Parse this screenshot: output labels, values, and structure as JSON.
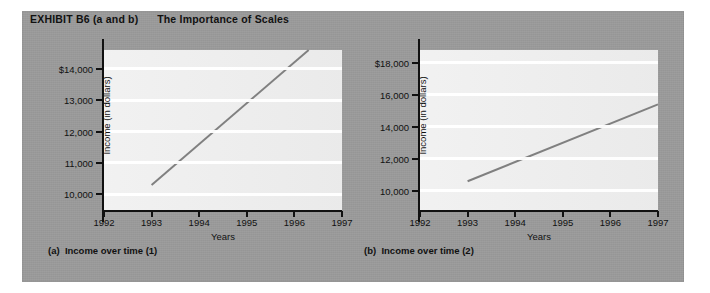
{
  "exhibit": {
    "title": "EXHIBIT B6 (a and b)      The Importance of Scales",
    "panel_color": "#9b9b9b",
    "line_color": "#808080",
    "plot_color": "#efefef",
    "gridline_color": "#ffffff"
  },
  "chart_data": [
    {
      "type": "line",
      "id": "a",
      "title": "Income over time (1)",
      "caption": "(a)  Income over time (1)",
      "xlabel": "Years",
      "ylabel": "Income (in dollars)",
      "x": [
        1993,
        1996.3
      ],
      "values": [
        10300,
        14600
      ],
      "categories": [
        "1992",
        "1993",
        "1994",
        "1995",
        "1996",
        "1997"
      ],
      "xlim": [
        1992,
        1997
      ],
      "ylim": [
        9500,
        14600
      ],
      "yticks": [
        10000,
        11000,
        12000,
        13000,
        14000
      ],
      "ytick_labels": [
        "10,000",
        "11,000",
        "12,000",
        "13,000",
        "$14,000"
      ],
      "grid": true,
      "legend": "none"
    },
    {
      "type": "line",
      "id": "b",
      "title": "Income over time (2)",
      "caption": "(b)  Income over time (2)",
      "xlabel": "Years",
      "ylabel": "Income (in dollars)",
      "x": [
        1993,
        1997
      ],
      "values": [
        10600,
        15400
      ],
      "categories": [
        "1992",
        "1993",
        "1994",
        "1995",
        "1996",
        "1997"
      ],
      "xlim": [
        1992,
        1997
      ],
      "ylim": [
        8800,
        18800
      ],
      "yticks": [
        10000,
        12000,
        14000,
        16000,
        18000
      ],
      "ytick_labels": [
        "10,000",
        "12,000",
        "14,000",
        "16,000",
        "$18,000"
      ],
      "grid": true,
      "legend": "none"
    }
  ]
}
